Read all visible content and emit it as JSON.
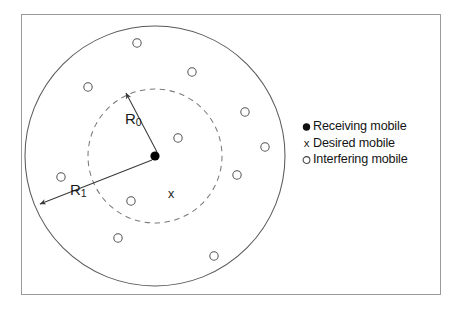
{
  "figure": {
    "frame": {
      "x": 21,
      "y": 14,
      "width": 420,
      "height": 281,
      "stroke": "#9a9a9a"
    },
    "colors": {
      "outline": "#5a5a5a",
      "dashed": "#7a7a7a",
      "marker_fill": "#000000",
      "text": "#141414",
      "frame": "#9a9a9a"
    }
  },
  "diagram": {
    "center": {
      "x": 155,
      "y": 156
    },
    "outer_circle": {
      "cx": 155,
      "cy": 156,
      "r": 130,
      "style": "solid",
      "label": "R1"
    },
    "inner_circle": {
      "cx": 155,
      "cy": 156,
      "r": 67,
      "style": "dashed",
      "label": "R0"
    },
    "receiving_mobile": {
      "x": 155,
      "y": 156,
      "r": 4.6
    },
    "desired_mobile": {
      "x": 172,
      "y": 195,
      "glyph": "x"
    },
    "radius_labels": {
      "r0": {
        "base": "R",
        "sub": "0",
        "x": 125,
        "y": 110,
        "arrow_from": {
          "x": 157,
          "y": 152
        },
        "arrow_to": {
          "x": 125,
          "y": 92
        }
      },
      "r1": {
        "base": "R",
        "sub": "1",
        "x": 70,
        "y": 181,
        "arrow_from": {
          "x": 152,
          "y": 160
        },
        "arrow_to": {
          "x": 39,
          "y": 205
        }
      }
    },
    "interfering_mobiles": [
      {
        "x": 137,
        "y": 43
      },
      {
        "x": 192,
        "y": 72
      },
      {
        "x": 88,
        "y": 87
      },
      {
        "x": 245,
        "y": 112
      },
      {
        "x": 178,
        "y": 138
      },
      {
        "x": 265,
        "y": 147
      },
      {
        "x": 237,
        "y": 175
      },
      {
        "x": 61,
        "y": 177
      },
      {
        "x": 131,
        "y": 201
      },
      {
        "x": 118,
        "y": 238
      },
      {
        "x": 214,
        "y": 256
      }
    ],
    "marker_radius": 4.2
  },
  "legend": {
    "items": [
      {
        "marker": "filled-circle-marker",
        "glyph": "",
        "label": "Receiving mobile"
      },
      {
        "marker": "x-marker",
        "glyph": "x",
        "label": "Desired mobile"
      },
      {
        "marker": "open-circle-marker",
        "glyph": "",
        "label": "Interfering mobile"
      }
    ]
  }
}
